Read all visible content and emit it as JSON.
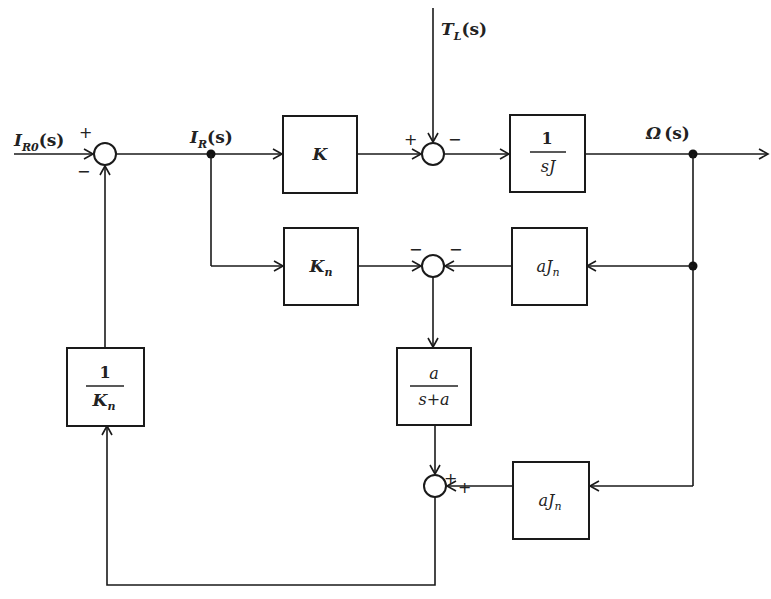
{
  "diagram": {
    "type": "block-diagram",
    "signals": {
      "input": {
        "main": "I",
        "sub": "R0",
        "arg": "(s)"
      },
      "current": {
        "main": "I",
        "sub": "R",
        "arg": "(s)"
      },
      "disturbance": {
        "main": "T",
        "sub": "L",
        "arg": "(s)"
      },
      "output": {
        "main": "Ω",
        "arg": "(s)"
      }
    },
    "blocks": {
      "gain_k": {
        "label": "K"
      },
      "plant": {
        "num": "1",
        "den": "sJ"
      },
      "nominal_gain": {
        "main": "K",
        "sub": "n"
      },
      "inertia_upper": {
        "main": "aJ",
        "sub": "n"
      },
      "filter": {
        "num": "a",
        "den": "s+a"
      },
      "inertia_lower": {
        "main": "aJ",
        "sub": "n"
      },
      "inverse_gain": {
        "num": "1",
        "den_main": "K",
        "den_sub": "n"
      }
    },
    "summing_junctions": {
      "sj_input": {
        "plus": "+",
        "minus": "−"
      },
      "sj_torque": {
        "plus": "+",
        "minus": "−"
      },
      "sj_estimate": {
        "minus_left": "−",
        "minus_right": "−"
      },
      "sj_output": {
        "plus_top": "+",
        "plus_right": "+"
      }
    }
  }
}
